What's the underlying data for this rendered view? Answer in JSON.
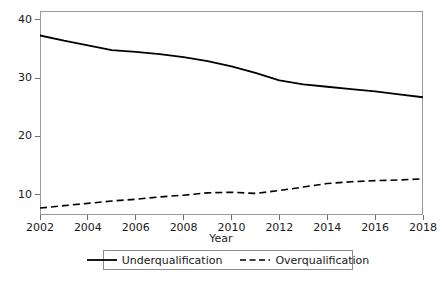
{
  "chart_data": {
    "type": "line",
    "title": "",
    "xlabel": "Year",
    "ylabel": "",
    "x": [
      2002,
      2003,
      2004,
      2005,
      2006,
      2007,
      2008,
      2009,
      2010,
      2011,
      2012,
      2013,
      2014,
      2015,
      2016,
      2017,
      2018
    ],
    "xlim": [
      2002,
      2018
    ],
    "ylim": [
      6.5,
      41.5
    ],
    "grid": false,
    "legend_position": "bottom-center",
    "x_tick_labels": [
      "2002",
      "2004",
      "2006",
      "2008",
      "2010",
      "2012",
      "2014",
      "2016",
      "2018"
    ],
    "x_tick_values": [
      2002,
      2004,
      2006,
      2008,
      2010,
      2012,
      2014,
      2016,
      2018
    ],
    "y_tick_labels": [
      "10",
      "20",
      "30",
      "40"
    ],
    "y_tick_values": [
      10,
      20,
      30,
      40
    ],
    "series": [
      {
        "name": "Underqualification",
        "style": "solid",
        "color": "#000000",
        "values": [
          37.3,
          36.4,
          35.6,
          34.8,
          34.5,
          34.1,
          33.6,
          32.9,
          32.0,
          30.9,
          29.6,
          28.9,
          28.5,
          28.1,
          27.7,
          27.2,
          26.7
        ]
      },
      {
        "name": "Overqualification",
        "style": "dashed",
        "color": "#000000",
        "values": [
          7.7,
          8.1,
          8.5,
          8.9,
          9.2,
          9.6,
          9.9,
          10.3,
          10.4,
          10.2,
          10.7,
          11.3,
          11.9,
          12.2,
          12.4,
          12.5,
          12.7
        ]
      }
    ]
  },
  "legend": {
    "items": [
      {
        "label": "Underqualification",
        "style": "solid"
      },
      {
        "label": "Overqualification",
        "style": "dashed"
      }
    ]
  },
  "axes": {
    "x_title": "Year"
  },
  "colors": {
    "line": "#000000",
    "frame": "#9a9a9a",
    "tick": "#6f6f6f",
    "text": "#1a1a1a",
    "background": "#ffffff"
  }
}
